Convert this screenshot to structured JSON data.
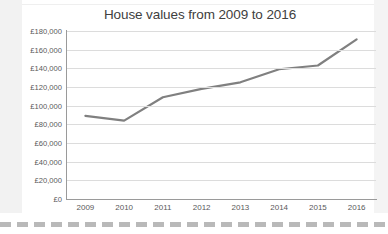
{
  "chart_data": {
    "type": "line",
    "title": "House values from 2009 to 2016",
    "xlabel": "",
    "ylabel": "",
    "categories": [
      "2009",
      "2010",
      "2011",
      "2012",
      "2013",
      "2014",
      "2015",
      "2016"
    ],
    "values": [
      89000,
      84000,
      109000,
      118000,
      125000,
      139000,
      143000,
      171000
    ],
    "series": [
      {
        "name": "House values",
        "values": [
          89000,
          84000,
          109000,
          118000,
          125000,
          139000,
          143000,
          171000
        ]
      }
    ],
    "ylim": [
      0,
      180000
    ],
    "y_tick_values": [
      0,
      20000,
      40000,
      60000,
      80000,
      100000,
      120000,
      140000,
      160000,
      180000
    ],
    "y_tick_labels": [
      "£0",
      "£20,000",
      "£40,000",
      "£60,000",
      "£80,000",
      "£100,000",
      "£120,000",
      "£140,000",
      "£160,000",
      "£180,000"
    ],
    "x_tick_labels": [
      "2009",
      "2010",
      "2011",
      "2012",
      "2013",
      "2014",
      "2015",
      "2016"
    ],
    "grid": true,
    "legend": false,
    "legend_position": "none",
    "line_color": "#808080",
    "gridline_color": "#dcdcdc",
    "axis_color": "#9a9a9a",
    "text_color": "#59595b",
    "background_color": "#ffffff"
  }
}
